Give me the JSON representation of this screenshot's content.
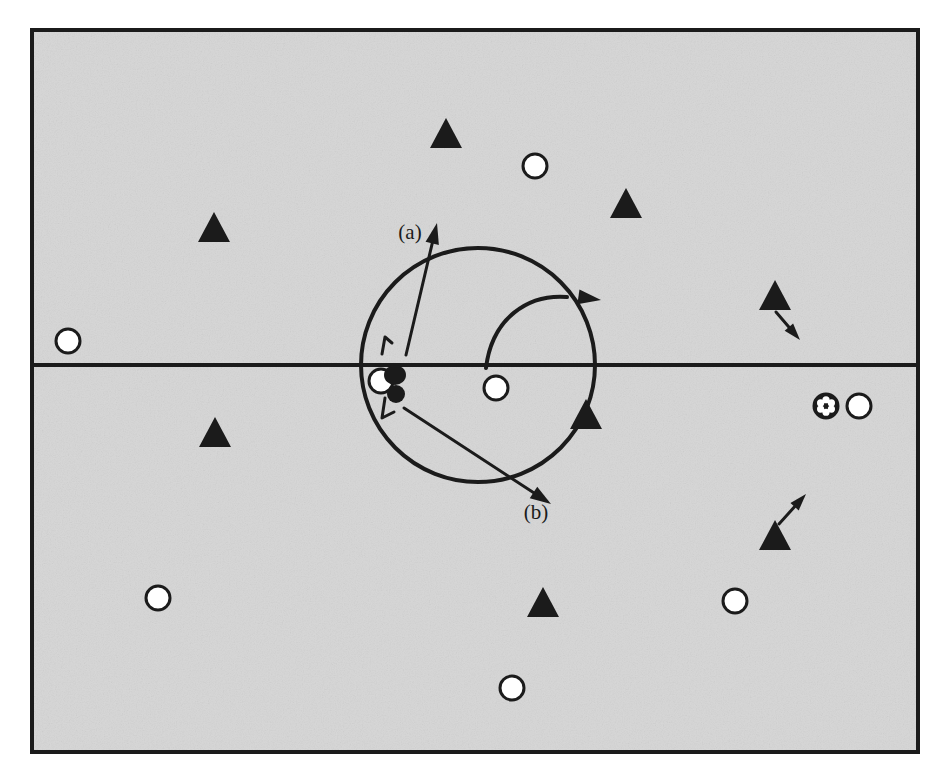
{
  "figure": {
    "kind": "schematic-diagram",
    "background_color": "#d6d6d6",
    "page_color": "#ffffff",
    "ink_color": "#1b1b1b",
    "frame": {
      "name": "outer-frame",
      "x": 32,
      "y": 30,
      "width": 886,
      "height": 722,
      "stroke_width": 4
    },
    "divider": {
      "name": "horizontal-interface-line",
      "y": 365,
      "x_start": 34,
      "x_end": 916,
      "stroke_width": 4
    },
    "big_circle": {
      "name": "orbit-circle",
      "cx": 478,
      "cy": 365,
      "r": 117,
      "stroke_width": 4
    },
    "labels": [
      {
        "name": "label-a",
        "text": "(a)",
        "x": 410,
        "y": 239
      },
      {
        "name": "label-b",
        "text": "(b)",
        "x": 536,
        "y": 519
      }
    ],
    "markers": {
      "open_circle": {
        "name": "open-circle-marker",
        "r": 12,
        "fill": "#ffffff",
        "stroke_width": 3
      },
      "filled_triangle": {
        "name": "filled-triangle-marker",
        "half_width": 16,
        "height": 30,
        "fill": "#1b1b1b"
      },
      "spoked_circle": {
        "name": "spoked-circle-marker",
        "r": 12,
        "fill": "#1b1b1b",
        "stroke_width": 3
      }
    },
    "open_circles": [
      {
        "name": "open-circle-top-left",
        "cx": 68,
        "cy": 341
      },
      {
        "name": "open-circle-top-center",
        "cx": 535,
        "cy": 166
      },
      {
        "name": "open-circle-center-orbit",
        "cx": 496,
        "cy": 388
      },
      {
        "name": "open-circle-right-of-spoke",
        "cx": 859,
        "cy": 406
      },
      {
        "name": "open-circle-bottom-left",
        "cx": 158,
        "cy": 598
      },
      {
        "name": "open-circle-bottom-right",
        "cx": 735,
        "cy": 601
      },
      {
        "name": "open-circle-bottom-center",
        "cx": 512,
        "cy": 688
      },
      {
        "name": "open-circle-core",
        "cx": 381,
        "cy": 381
      }
    ],
    "spoked_circles": [
      {
        "name": "spoked-circle-right",
        "cx": 826,
        "cy": 406
      }
    ],
    "triangles": [
      {
        "name": "triangle-top-center",
        "cx": 446,
        "cy": 133
      },
      {
        "name": "triangle-top-right",
        "cx": 626,
        "cy": 203
      },
      {
        "name": "triangle-upper-left",
        "cx": 214,
        "cy": 227
      },
      {
        "name": "triangle-right-upper",
        "cx": 775,
        "cy": 295
      },
      {
        "name": "triangle-on-circle-edge",
        "cx": 586,
        "cy": 414
      },
      {
        "name": "triangle-mid-left",
        "cx": 215,
        "cy": 432
      },
      {
        "name": "triangle-right-lower",
        "cx": 775,
        "cy": 535
      },
      {
        "name": "triangle-bottom-center",
        "cx": 543,
        "cy": 602
      }
    ],
    "straight_arrows": [
      {
        "name": "arrow-a-outward",
        "x1": 406,
        "y1": 355,
        "x2": 437,
        "y2": 223,
        "stroke_width": 3,
        "head_size": 11
      },
      {
        "name": "arrow-b-outward",
        "x1": 404,
        "y1": 408,
        "x2": 551,
        "y2": 504,
        "stroke_width": 3,
        "head_size": 11
      },
      {
        "name": "arrow-drift-down-right",
        "x1": 776,
        "y1": 312,
        "x2": 800,
        "y2": 340,
        "stroke_width": 3,
        "head_size": 9
      },
      {
        "name": "arrow-drift-up-right",
        "x1": 779,
        "y1": 524,
        "x2": 806,
        "y2": 494,
        "stroke_width": 3,
        "head_size": 9
      }
    ],
    "curved_arrows": [
      {
        "name": "arc-arrow-outflow",
        "path": "M 486,368 C 492,318 528,294 567,297",
        "stroke_width": 4,
        "head": {
          "tip_x": 601,
          "tip_y": 300,
          "angle": 8,
          "size": 12
        }
      }
    ],
    "core_cluster": {
      "name": "core-particle-cluster",
      "blobs": [
        {
          "name": "core-blob-upper",
          "cx": 395,
          "cy": 375,
          "rx": 11,
          "ry": 10
        },
        {
          "name": "core-blob-lower",
          "cx": 396,
          "cy": 394,
          "rx": 9,
          "ry": 9
        }
      ],
      "stems": [
        {
          "name": "core-stem-up",
          "d": "M 382,354 L 385,337 L 392,343",
          "stroke_width": 3
        },
        {
          "name": "core-stem-down",
          "d": "M 385,398 L 382,418 L 394,412",
          "stroke_width": 3
        }
      ]
    }
  }
}
